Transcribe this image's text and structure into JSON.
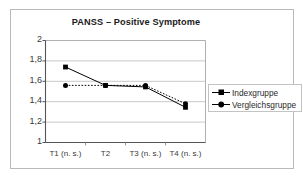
{
  "figure": {
    "frame_color": "#b9b9b9",
    "background": "#ffffff"
  },
  "chart_data": {
    "type": "line",
    "title": "PANSS – Positive Symptome",
    "xlabel": "",
    "ylabel": "",
    "categories": [
      "T1 (n. s.)",
      "T2",
      "T3 (n. s.)",
      "T4 (n. s.)"
    ],
    "series": [
      {
        "name": "Indexgruppe",
        "marker": "square",
        "linestyle": "solid",
        "color": "#000000",
        "values": [
          1.74,
          1.56,
          1.545,
          1.345
        ]
      },
      {
        "name": "Vergleichsgruppe",
        "marker": "circle",
        "linestyle": "dotted",
        "color": "#000000",
        "values": [
          1.56,
          1.56,
          1.56,
          1.38
        ]
      }
    ],
    "ylim": [
      1,
      2
    ],
    "yticks": [
      1,
      1.2,
      1.4,
      1.6,
      1.8,
      2
    ],
    "ytick_labels": [
      "1",
      "1,2",
      "1,4",
      "1,6",
      "1,8",
      "2"
    ],
    "grid": true,
    "grid_axis": "y",
    "legend_position": "right"
  },
  "legend": {
    "entries": [
      {
        "label": "Indexgruppe",
        "marker": "square"
      },
      {
        "label": "Vergleichsgruppe",
        "marker": "circle"
      }
    ]
  }
}
